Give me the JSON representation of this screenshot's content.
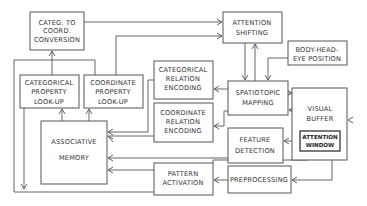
{
  "diagram": {
    "type": "block-diagram",
    "boxes": {
      "categ_to_coord": {
        "lines": [
          "CATEG. TO",
          "COORD.",
          "CONVERSION"
        ]
      },
      "attention_shifting": {
        "lines": [
          "ATTENTION",
          "SHIFTING"
        ]
      },
      "body_head_eye": {
        "lines": [
          "BODY-HEAD-",
          "EYE POSITION"
        ]
      },
      "categorical_property": {
        "lines": [
          "CATEGORICAL",
          "PROPERTY",
          "LOOK-UP"
        ]
      },
      "coordinate_property": {
        "lines": [
          "COORDINATE",
          "PROPERTY",
          "LOOK-UP"
        ]
      },
      "categorical_relation": {
        "lines": [
          "CATEGORICAL",
          "RELATION",
          "ENCODING"
        ]
      },
      "coordinate_relation": {
        "lines": [
          "COORDINATE",
          "RELATION",
          "ENCODING"
        ]
      },
      "spatiotopic_mapping": {
        "lines": [
          "SPATIOTOPIC",
          "MAPPING"
        ]
      },
      "visual_buffer": {
        "lines": [
          "VISUAL",
          "BUFFER"
        ]
      },
      "attention_window": {
        "lines": [
          "ATTENTION",
          "WINDOW"
        ]
      },
      "associative_memory": {
        "lines": [
          "ASSOCIATIVE",
          "MEMORY"
        ]
      },
      "feature_detection": {
        "lines": [
          "FEATURE",
          "DETECTION"
        ]
      },
      "pattern_activation": {
        "lines": [
          "PATTERN",
          "ACTIVATION"
        ]
      },
      "preprocessing": {
        "lines": [
          "PREPROCESSING"
        ]
      }
    },
    "colors": {
      "stroke": "#555555",
      "text": "#333333",
      "background": "#ffffff"
    }
  }
}
